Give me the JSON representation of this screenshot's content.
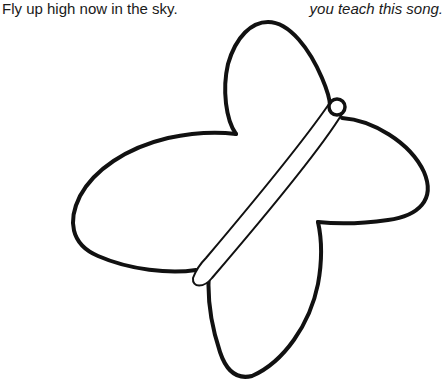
{
  "page": {
    "left_text": "Fly up high now in the sky.",
    "right_text": "you teach this song."
  },
  "illustration": {
    "subject": "butterfly outline",
    "style": "black line art coloring page",
    "stroke_color": "#111111",
    "background_color": "#ffffff",
    "parts": [
      "upper-wing",
      "right-wing",
      "lower-wing",
      "left-wing",
      "body",
      "head"
    ]
  }
}
